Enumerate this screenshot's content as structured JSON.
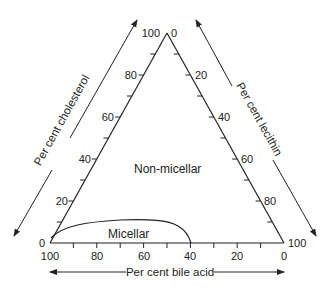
{
  "chart_data": {
    "type": "ternary",
    "title": "",
    "axes": {
      "left": {
        "label": "Per cent cholesterol",
        "from": 0,
        "to": 100,
        "tick_step": 10,
        "tick_labels": [
          "0",
          "20",
          "40",
          "60",
          "80",
          "100"
        ]
      },
      "right": {
        "label": "Per cent lecithin",
        "from": 0,
        "to": 100,
        "tick_step": 10,
        "tick_labels": [
          "0",
          "20",
          "40",
          "60",
          "80",
          "100"
        ]
      },
      "bottom": {
        "label": "Per cent bile acid",
        "from": 100,
        "to": 0,
        "tick_step": 10,
        "tick_labels": [
          "100",
          "80",
          "60",
          "40",
          "20",
          "0"
        ]
      }
    },
    "regions": [
      {
        "name": "Non-micellar",
        "label": "Non-micellar"
      },
      {
        "name": "Micellar",
        "label": "Micellar"
      }
    ],
    "boundary_curve": {
      "description": "Micellar boundary from bile acid 100% (left corner) arching to about 8% cholesterol, ending at bile acid 40% / lecithin 60% on base",
      "points_bile_lecithin_cholesterol": [
        [
          97,
          0,
          3
        ],
        [
          90,
          5,
          5
        ],
        [
          80,
          13,
          7
        ],
        [
          70,
          22,
          8
        ],
        [
          60,
          32,
          8
        ],
        [
          50,
          43,
          7
        ],
        [
          45,
          50,
          5
        ],
        [
          40,
          60,
          0
        ]
      ]
    }
  },
  "labels": {
    "left_axis": "Per cent cholesterol",
    "right_axis": "Per cent lecithin",
    "bottom_axis": "Per cent bile acid",
    "non_micellar": "Non-micellar",
    "micellar": "Micellar"
  },
  "ticks": {
    "left": [
      "0",
      "20",
      "40",
      "60",
      "80",
      "100"
    ],
    "right": [
      "0",
      "20",
      "40",
      "60",
      "80",
      "100"
    ],
    "bottom": [
      "100",
      "80",
      "60",
      "40",
      "20",
      "0"
    ]
  },
  "colors": {
    "line": "#222222",
    "text": "#222222",
    "background": "#ffffff"
  }
}
